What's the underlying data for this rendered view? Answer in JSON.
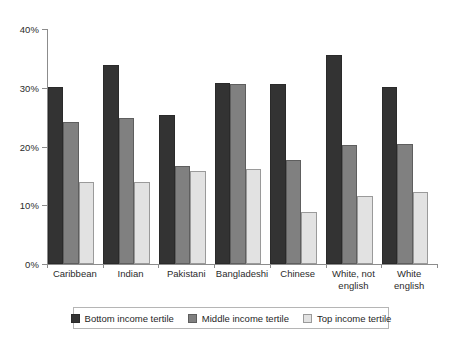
{
  "chart_data": {
    "type": "bar",
    "title": "",
    "subtitle": "",
    "xlabel": "",
    "ylabel": "",
    "ylim": [
      0,
      40
    ],
    "yticks": [
      0,
      10,
      20,
      30,
      40
    ],
    "ytick_labels": [
      "0%",
      "10%",
      "20%",
      "30%",
      "40%"
    ],
    "grid": false,
    "legend_position": "bottom",
    "value_format": "percent",
    "categories": [
      "Caribbean",
      "Indian",
      "Pakistani",
      "Bangladeshi",
      "Chinese",
      "White, not\nenglish",
      "White english"
    ],
    "series": [
      {
        "name": "Bottom income tertile",
        "color": "#333333",
        "values": [
          30.2,
          33.9,
          25.4,
          30.8,
          30.7,
          35.5,
          30.1
        ]
      },
      {
        "name": "Middle income tertile",
        "color": "#808080",
        "values": [
          24.1,
          24.8,
          16.6,
          30.6,
          17.7,
          20.3,
          20.5
        ]
      },
      {
        "name": "Top income tertile",
        "color": "#e2e2e2",
        "values": [
          13.9,
          13.9,
          15.9,
          16.2,
          8.9,
          11.5,
          12.2
        ]
      }
    ]
  },
  "legend": {
    "items": [
      {
        "label": "Bottom income tertile",
        "swatch": "dark-swatch"
      },
      {
        "label": "Middle income tertile",
        "swatch": "medium-swatch"
      },
      {
        "label": "Top income tertile",
        "swatch": "light-swatch"
      }
    ]
  }
}
